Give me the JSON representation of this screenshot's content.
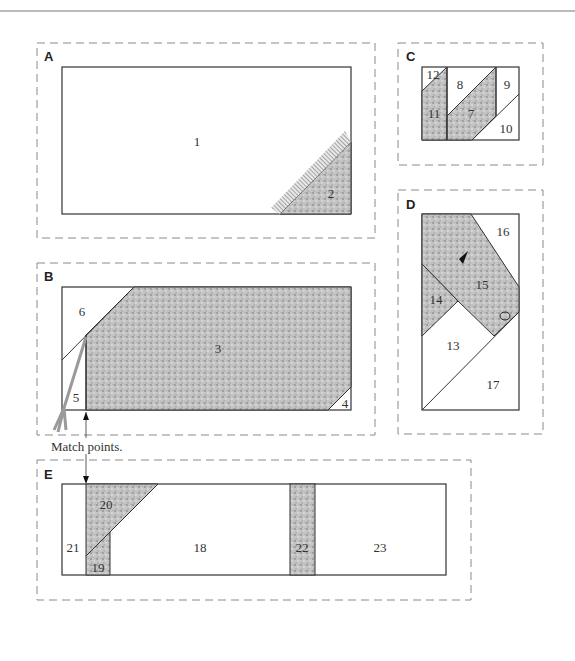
{
  "figure": {
    "colors": {
      "line": "#333333",
      "dash": "#8a8a8a",
      "fabric": "#bdbdbd",
      "fabric_dark": "#9a9a9a"
    },
    "sections": [
      {
        "id": "A",
        "label": "A",
        "pieces": [
          "1",
          "2"
        ]
      },
      {
        "id": "B",
        "label": "B",
        "pieces": [
          "3",
          "4",
          "5",
          "6"
        ]
      },
      {
        "id": "C",
        "label": "C",
        "pieces": [
          "7",
          "8",
          "9",
          "10",
          "11",
          "12"
        ]
      },
      {
        "id": "D",
        "label": "D",
        "pieces": [
          "13",
          "14",
          "15",
          "16",
          "17"
        ]
      },
      {
        "id": "E",
        "label": "E",
        "pieces": [
          "18",
          "19",
          "20",
          "21",
          "22",
          "23"
        ]
      }
    ],
    "annotation": {
      "match_points": "Match points."
    }
  }
}
